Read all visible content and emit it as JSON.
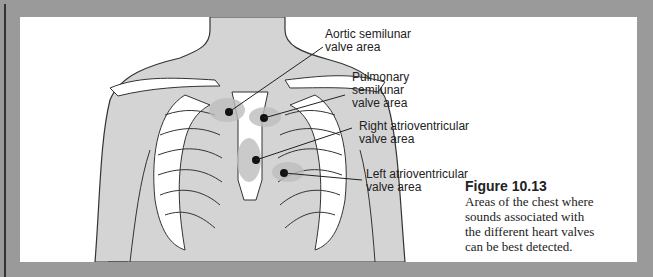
{
  "figure": {
    "number": "Figure 10.13",
    "caption_lines": [
      "Areas of the chest where",
      "sounds associated with",
      "the different heart valves",
      "can be best detected."
    ]
  },
  "labels": {
    "aortic": [
      "Aortic semilunar",
      "valve area"
    ],
    "pulmonary": [
      "Pulmonary",
      "semilunar",
      "valve area"
    ],
    "right_av": [
      "Right atrioventricular",
      "valve area"
    ],
    "left_av": [
      "Left atrioventricular",
      "valve area"
    ]
  },
  "colors": {
    "frame": "#9a9a9a",
    "panel": "#ffffff",
    "skin": "#d4d4d4",
    "bone": "#ffffff",
    "outline": "#333333",
    "highlight": "#bdbdbd",
    "marker": "#111111"
  }
}
